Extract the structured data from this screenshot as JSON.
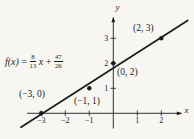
{
  "figure": {
    "background": "#f7f6f3",
    "ink": "#1c1c1c"
  },
  "equation": {
    "lhs": "f(x)",
    "equals": "=",
    "frac1": {
      "num": "8",
      "den": "13"
    },
    "variable": "x",
    "plus": "+",
    "frac2": {
      "num": "47",
      "den": "26"
    }
  },
  "chart_data": {
    "type": "scatter",
    "title": "",
    "xlabel": "x",
    "ylabel": "y",
    "x_ticks": [
      -3,
      -2,
      -1,
      1,
      2
    ],
    "y_ticks": [
      1,
      2,
      3
    ],
    "xlim": [
      -3.85,
      3.1
    ],
    "ylim": [
      -0.75,
      3.95
    ],
    "grid": false,
    "points": [
      {
        "x": -3,
        "y": 0,
        "label": "(−3, 0)"
      },
      {
        "x": -1,
        "y": 1,
        "label": "(−1, 1)"
      },
      {
        "x": 0,
        "y": 2,
        "label": "(0, 2)"
      },
      {
        "x": 2,
        "y": 3,
        "label": "(2, 3)"
      }
    ],
    "line": {
      "slope_num": 8,
      "slope_den": 13,
      "intercept_num": 47,
      "intercept_den": 26,
      "equation": "f(x) = 8/13 x + 47/26"
    }
  }
}
